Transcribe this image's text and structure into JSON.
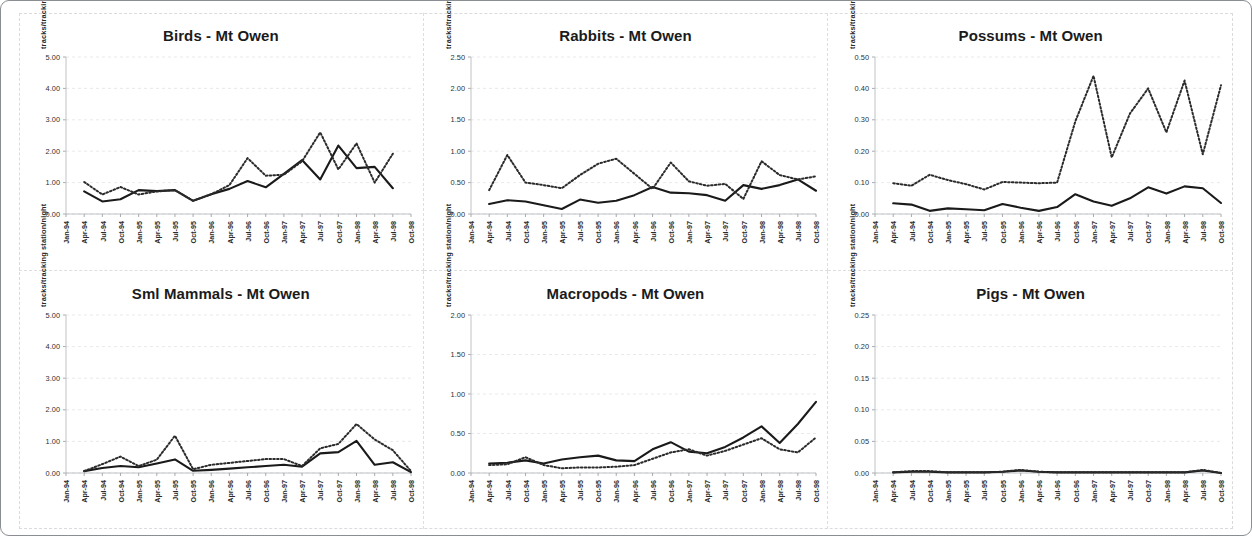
{
  "figure": {
    "name": "Mt Owen fauna tracking monitoring panels",
    "site": "Mt Owen",
    "y_axis_title": "tracks/tracking  station/night",
    "x_tick_labels": [
      "Jan-94",
      "Apr-94",
      "Jul-94",
      "Oct-94",
      "Jan-95",
      "Apr-95",
      "Jul-95",
      "Oct-95",
      "Jan-96",
      "Apr-96",
      "Jul-96",
      "Oct-96",
      "Jan-97",
      "Apr-97",
      "Jul-97",
      "Oct-97",
      "Jan-98",
      "Apr-98",
      "Jul-98",
      "Oct-98"
    ],
    "colors": {
      "solid_series": "#1a1a1a",
      "dotted_series": "#2b2b2b",
      "gridline": "#e2e3e6",
      "axis": "#b9bbbe",
      "panel_border": "#8a8d92",
      "background": "#ffffff"
    }
  },
  "chart_data": [
    {
      "type": "line",
      "title": "Birds - Mt Owen",
      "xlabel": "",
      "ylabel": "tracks/tracking  station/night",
      "ylim": [
        0,
        5
      ],
      "ytick_labels": [
        "0.00",
        "1.00",
        "2.00",
        "3.00",
        "4.00",
        "5.00"
      ],
      "ytick_values": [
        0,
        1,
        2,
        3,
        4,
        5
      ],
      "grid": true,
      "legend": "none",
      "x": [
        "Jan-94",
        "Apr-94",
        "Jul-94",
        "Oct-94",
        "Jan-95",
        "Apr-95",
        "Jul-95",
        "Oct-95",
        "Jan-96",
        "Apr-96",
        "Jul-96",
        "Oct-96",
        "Jan-97",
        "Apr-97",
        "Jul-97",
        "Oct-97",
        "Jan-98",
        "Apr-98",
        "Jul-98",
        "Oct-98"
      ],
      "series": [
        {
          "name": "solid",
          "style": "solid",
          "values": [
            null,
            0.72,
            0.4,
            0.47,
            0.76,
            0.73,
            0.76,
            0.42,
            0.63,
            0.8,
            1.05,
            0.85,
            1.28,
            1.72,
            1.1,
            2.18,
            1.46,
            1.5,
            0.82,
            null
          ]
        },
        {
          "name": "dotted",
          "style": "dotted",
          "values": [
            null,
            1.02,
            0.62,
            0.86,
            0.62,
            0.72,
            0.76,
            0.42,
            0.63,
            0.92,
            1.78,
            1.22,
            1.25,
            1.68,
            2.6,
            1.42,
            2.25,
            1.0,
            1.92,
            null
          ]
        }
      ]
    },
    {
      "type": "line",
      "title": "Rabbits - Mt Owen",
      "xlabel": "",
      "ylabel": "tracks/tracking  station/night",
      "ylim": [
        0,
        2.5
      ],
      "ytick_labels": [
        "0.00",
        "0.50",
        "1.00",
        "1.50",
        "2.00",
        "2.50"
      ],
      "ytick_values": [
        0,
        0.5,
        1.0,
        1.5,
        2.0,
        2.5
      ],
      "grid": true,
      "legend": "none",
      "x": [
        "Jan-94",
        "Apr-94",
        "Jul-94",
        "Oct-94",
        "Jan-95",
        "Apr-95",
        "Jul-95",
        "Oct-95",
        "Jan-96",
        "Apr-96",
        "Jul-96",
        "Oct-96",
        "Jan-97",
        "Apr-97",
        "Jul-97",
        "Oct-97",
        "Jan-98",
        "Apr-98",
        "Jul-98",
        "Oct-98"
      ],
      "series": [
        {
          "name": "solid",
          "style": "solid",
          "values": [
            null,
            0.16,
            0.22,
            0.2,
            0.14,
            0.08,
            0.23,
            0.18,
            0.21,
            0.3,
            0.43,
            0.34,
            0.33,
            0.3,
            0.21,
            0.46,
            0.4,
            0.46,
            0.55,
            0.37
          ]
        },
        {
          "name": "dotted",
          "style": "dotted",
          "values": [
            null,
            0.38,
            0.94,
            0.5,
            0.46,
            0.41,
            0.62,
            0.8,
            0.88,
            0.64,
            0.4,
            0.82,
            0.52,
            0.45,
            0.48,
            0.24,
            0.84,
            0.62,
            0.55,
            0.6
          ]
        }
      ]
    },
    {
      "type": "line",
      "title": "Possums - Mt Owen",
      "xlabel": "",
      "ylabel": "tracks/tracking  station/night",
      "ylim": [
        0,
        0.5
      ],
      "ytick_labels": [
        "0.00",
        "0.10",
        "0.20",
        "0.30",
        "0.40",
        "0.50"
      ],
      "ytick_values": [
        0,
        0.1,
        0.2,
        0.3,
        0.4,
        0.5
      ],
      "grid": true,
      "legend": "none",
      "x": [
        "Jan-94",
        "Apr-94",
        "Jul-94",
        "Oct-94",
        "Jan-95",
        "Apr-95",
        "Jul-95",
        "Oct-95",
        "Jan-96",
        "Apr-96",
        "Jul-96",
        "Oct-96",
        "Jan-97",
        "Apr-97",
        "Jul-97",
        "Oct-97",
        "Jan-98",
        "Apr-98",
        "Jul-98",
        "Oct-98"
      ],
      "series": [
        {
          "name": "solid",
          "style": "solid",
          "values": [
            null,
            0.034,
            0.03,
            0.01,
            0.018,
            0.015,
            0.012,
            0.032,
            0.02,
            0.01,
            0.022,
            0.063,
            0.04,
            0.026,
            0.05,
            0.085,
            0.065,
            0.088,
            0.082,
            0.035
          ]
        },
        {
          "name": "dotted",
          "style": "dotted",
          "values": [
            null,
            0.098,
            0.09,
            0.125,
            0.108,
            0.095,
            0.078,
            0.102,
            0.1,
            0.098,
            0.1,
            0.295,
            0.44,
            0.18,
            0.32,
            0.4,
            0.26,
            0.425,
            0.19,
            0.41
          ]
        }
      ]
    },
    {
      "type": "line",
      "title": "Sml Mammals - Mt Owen",
      "xlabel": "",
      "ylabel": "tracks/tracking  station/night",
      "ylim": [
        0,
        5
      ],
      "ytick_labels": [
        "0.00",
        "1.00",
        "2.00",
        "3.00",
        "4.00",
        "5.00"
      ],
      "ytick_values": [
        0,
        1,
        2,
        3,
        4,
        5
      ],
      "grid": true,
      "legend": "none",
      "x": [
        "Jan-94",
        "Apr-94",
        "Jul-94",
        "Oct-94",
        "Jan-95",
        "Apr-95",
        "Jul-95",
        "Oct-95",
        "Jan-96",
        "Apr-96",
        "Jul-96",
        "Oct-96",
        "Jan-97",
        "Apr-97",
        "Jul-97",
        "Oct-97",
        "Jan-98",
        "Apr-98",
        "Jul-98",
        "Oct-98"
      ],
      "series": [
        {
          "name": "solid",
          "style": "solid",
          "values": [
            null,
            0.06,
            0.16,
            0.22,
            0.18,
            0.3,
            0.43,
            0.07,
            0.1,
            0.14,
            0.18,
            0.22,
            0.26,
            0.2,
            0.62,
            0.66,
            1.02,
            0.26,
            0.34,
            0.03
          ]
        },
        {
          "name": "dotted",
          "style": "dotted",
          "values": [
            null,
            0.06,
            0.28,
            0.52,
            0.22,
            0.42,
            1.18,
            0.12,
            0.26,
            0.32,
            0.38,
            0.44,
            0.44,
            0.22,
            0.78,
            0.92,
            1.55,
            1.06,
            0.72,
            0.06
          ]
        }
      ]
    },
    {
      "type": "line",
      "title": "Macropods - Mt Owen",
      "xlabel": "",
      "ylabel": "tracks/tracking  station/night",
      "ylim": [
        0,
        2
      ],
      "ytick_labels": [
        "0.00",
        "0.50",
        "1.00",
        "1.50",
        "2.00"
      ],
      "ytick_values": [
        0,
        0.5,
        1.0,
        1.5,
        2.0
      ],
      "grid": true,
      "legend": "none",
      "x": [
        "Jan-94",
        "Apr-94",
        "Jul-94",
        "Oct-94",
        "Jan-95",
        "Apr-95",
        "Jul-95",
        "Oct-95",
        "Jan-96",
        "Apr-96",
        "Jul-96",
        "Oct-96",
        "Jan-97",
        "Apr-97",
        "Jul-97",
        "Oct-97",
        "Jan-98",
        "Apr-98",
        "Jul-98",
        "Oct-98"
      ],
      "series": [
        {
          "name": "solid",
          "style": "solid",
          "values": [
            null,
            0.12,
            0.13,
            0.16,
            0.12,
            0.17,
            0.2,
            0.22,
            0.16,
            0.15,
            0.3,
            0.39,
            0.27,
            0.25,
            0.33,
            0.45,
            0.59,
            0.38,
            0.62,
            0.9
          ]
        },
        {
          "name": "dotted",
          "style": "dotted",
          "values": [
            null,
            0.1,
            0.11,
            0.2,
            0.1,
            0.06,
            0.07,
            0.07,
            0.08,
            0.1,
            0.18,
            0.26,
            0.3,
            0.22,
            0.28,
            0.36,
            0.44,
            0.3,
            0.26,
            0.45
          ]
        }
      ]
    },
    {
      "type": "line",
      "title": "Pigs - Mt Owen",
      "xlabel": "",
      "ylabel": "tracks/tracking  station/night",
      "ylim": [
        0,
        0.25
      ],
      "ytick_labels": [
        "0.00",
        "0.05",
        "0.10",
        "0.15",
        "0.20",
        "0.25"
      ],
      "ytick_values": [
        0,
        0.05,
        0.1,
        0.15,
        0.2,
        0.25
      ],
      "grid": true,
      "legend": "none",
      "x": [
        "Jan-94",
        "Apr-94",
        "Jul-94",
        "Oct-94",
        "Jan-95",
        "Apr-95",
        "Jul-95",
        "Oct-95",
        "Jan-96",
        "Apr-96",
        "Jul-96",
        "Oct-96",
        "Jan-97",
        "Apr-97",
        "Jul-97",
        "Oct-97",
        "Jan-98",
        "Apr-98",
        "Jul-98",
        "Oct-98"
      ],
      "series": [
        {
          "name": "solid",
          "style": "solid",
          "values": [
            null,
            0.001,
            0.002,
            0.002,
            0.001,
            0.001,
            0.001,
            0.002,
            0.004,
            0.002,
            0.001,
            0.001,
            0.001,
            0.001,
            0.001,
            0.001,
            0.001,
            0.001,
            0.004,
            0.0
          ]
        },
        {
          "name": "dotted",
          "style": "dotted",
          "values": [
            null,
            0.001,
            0.003,
            0.003,
            0.001,
            0.001,
            0.001,
            0.002,
            0.005,
            0.002,
            0.001,
            0.001,
            0.001,
            0.001,
            0.001,
            0.001,
            0.001,
            0.001,
            0.005,
            0.0
          ]
        }
      ]
    }
  ]
}
